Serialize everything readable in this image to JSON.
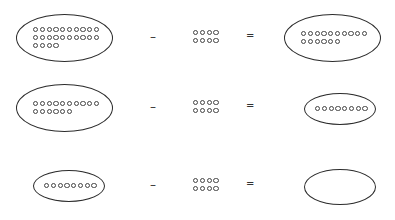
{
  "equations": [
    {
      "minuend": 24,
      "subtrahend": 8,
      "difference": 16,
      "minuend_rows": [
        10,
        10,
        4
      ],
      "subtrahend_rows": [
        4,
        4
      ],
      "difference_rows": [
        10,
        6
      ]
    },
    {
      "minuend": 16,
      "subtrahend": 8,
      "difference": 8,
      "minuend_rows": [
        10,
        6
      ],
      "subtrahend_rows": [
        4,
        4
      ],
      "difference_rows": [
        8
      ]
    },
    {
      "minuend": 8,
      "subtrahend": 8,
      "difference": 0,
      "minuend_rows": [
        8
      ],
      "subtrahend_rows": [
        4,
        4
      ],
      "difference_rows": []
    }
  ],
  "symbols": {
    "minus": "–",
    "equals": "="
  }
}
